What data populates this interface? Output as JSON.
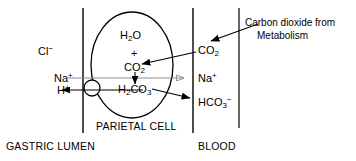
{
  "diagram": {
    "compartments": [
      {
        "name": "gastric-lumen",
        "label": "GASTRIC LUMEN"
      },
      {
        "name": "parietal-cell",
        "label": "PARIETAL CELL"
      },
      {
        "name": "blood",
        "label": "BLOOD"
      }
    ],
    "lumen_species": [
      {
        "name": "chloride",
        "base": "Cl",
        "sup": "−",
        "sub": ""
      },
      {
        "name": "sodium-lumen",
        "base": "Na",
        "sup": "+",
        "sub": ""
      },
      {
        "name": "hydrogen-lumen",
        "base": "H",
        "sup": "+",
        "sub": ""
      }
    ],
    "cell_species": [
      {
        "name": "water",
        "base": "H",
        "sub": "2",
        "tail": "O"
      },
      {
        "name": "plus-operator",
        "base": "+"
      },
      {
        "name": "carbon-dioxide-cell",
        "base": "CO",
        "sub": "2"
      },
      {
        "name": "carbonic-acid",
        "base": "H",
        "sub": "2",
        "mid": "CO",
        "sub2": "3"
      }
    ],
    "blood_species": [
      {
        "name": "carbon-dioxide-blood",
        "base": "CO",
        "sub": "2"
      },
      {
        "name": "sodium-blood",
        "base": "Na",
        "sup": "+"
      },
      {
        "name": "bicarbonate-blood",
        "base": "HCO",
        "sub": "3",
        "sup": "−"
      }
    ],
    "annotation": {
      "name": "carbon-dioxide-source",
      "line1": "Carbon dioxide from",
      "line2": "Metabolism"
    },
    "colors": {
      "stroke": "#000000",
      "sodium_arrow": "#8c8c8c",
      "background": "#ffffff",
      "text": "#000000"
    }
  }
}
